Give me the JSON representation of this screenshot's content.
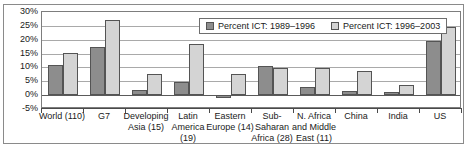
{
  "chart_data": {
    "type": "bar",
    "title": "",
    "subtitle": "",
    "xlabel": "",
    "ylabel": "",
    "ylim": [
      -5,
      30
    ],
    "ytick_labels": [
      "30%",
      "25%",
      "20%",
      "15%",
      "10%",
      "5%",
      "0%",
      "-5%"
    ],
    "ytick_values": [
      30,
      25,
      20,
      15,
      10,
      5,
      0,
      -5
    ],
    "grid": true,
    "legend_position": "top-right-inside",
    "categories": [
      "World (110)",
      "G7",
      "Developing Asia (15)",
      "Latin America (19)",
      "Eastern Europe (14)",
      "Sub-Saharan Africa (28)",
      "N. Africa and Middle East (11)",
      "China",
      "India",
      "US"
    ],
    "category_label_lines": [
      [
        "World (110)"
      ],
      [
        "G7"
      ],
      [
        "Developing",
        "Asia (15)"
      ],
      [
        "Latin",
        "America",
        "(19)"
      ],
      [
        "Eastern",
        "Europe (14)"
      ],
      [
        "Sub-",
        "Saharan",
        "Africa (28)"
      ],
      [
        "N. Africa",
        "and Middle",
        "East (11)"
      ],
      [
        "China"
      ],
      [
        "India"
      ],
      [
        "US"
      ]
    ],
    "series": [
      {
        "name": "Percent ICT: 1989–1996",
        "color": "#8d8d8d",
        "values": [
          10.7,
          17.5,
          2.0,
          4.9,
          -1.2,
          10.5,
          3.0,
          1.4,
          1.3,
          19.7
        ]
      },
      {
        "name": "Percent ICT: 1996–2003",
        "color": "#d4d4d4",
        "values": [
          15.1,
          27.0,
          7.7,
          18.4,
          7.8,
          9.7,
          9.7,
          8.6,
          3.5,
          24.7
        ]
      }
    ]
  },
  "legend": {
    "entries": [
      {
        "label": "Percent ICT: 1989–1996"
      },
      {
        "label": "Percent ICT: 1996–2003"
      }
    ]
  },
  "colors": {
    "series_1989_1996": "#8d8d8d",
    "series_1996_2003": "#d4d4d4",
    "gridline": "#a9a9a9",
    "axis": "#4a4a4a",
    "frame": "#8a8a8a",
    "background": "#ffffff",
    "text": "#1a1a1a"
  }
}
